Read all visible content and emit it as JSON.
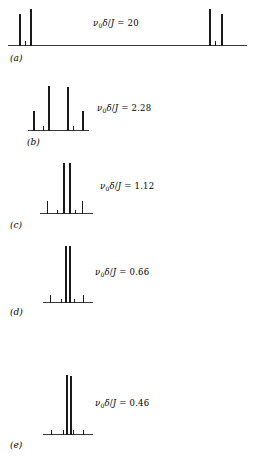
{
  "figure": {
    "ratio_symbol_nu": "ν",
    "ratio_symbol_sub": "0",
    "ratio_symbol_delta": "δ",
    "ratio_symbol_slash": "/",
    "ratio_symbol_j": "J",
    "ratio_symbol_equals": "="
  },
  "panels": [
    {
      "id": "a",
      "label": "(a)",
      "ratio_value": "20",
      "ratio_text": "ν₀δ/J = 20",
      "axis_left": 8,
      "axis_width": 239,
      "axis_height": 40,
      "peaks": [
        {
          "position": 0.0461,
          "height": 0.8,
          "name": "outer-left"
        },
        {
          "position": 0.0712,
          "height": 0.13,
          "name": "satellite-left"
        },
        {
          "position": 0.0921,
          "height": 0.92,
          "name": "inner-left"
        },
        {
          "position": 0.841,
          "height": 0.92,
          "name": "inner-right"
        },
        {
          "position": 0.8661,
          "height": 0.13,
          "name": "satellite-right"
        },
        {
          "position": 0.8912,
          "height": 0.8,
          "name": "outer-right"
        }
      ]
    },
    {
      "id": "b",
      "label": "(b)",
      "ratio_value": "2.28",
      "ratio_text": "ν₀δ/J = 2.28",
      "axis_left": 28,
      "axis_width": 61,
      "axis_height": 46,
      "peaks": [
        {
          "position": 0.085,
          "height": 0.44,
          "name": "outer-left"
        },
        {
          "position": 0.245,
          "height": 0.1,
          "name": "satellite-left"
        },
        {
          "position": 0.33,
          "height": 0.98,
          "name": "inner-left"
        },
        {
          "position": 0.64,
          "height": 0.96,
          "name": "inner-right"
        },
        {
          "position": 0.74,
          "height": 0.1,
          "name": "satellite-right"
        },
        {
          "position": 0.88,
          "height": 0.44,
          "name": "outer-right"
        }
      ]
    },
    {
      "id": "c",
      "label": "(c)",
      "ratio_value": "1.12",
      "ratio_text": "ν₀δ/J = 1.12",
      "axis_left": 40,
      "axis_width": 53,
      "axis_height": 52,
      "peaks": [
        {
          "position": 0.13,
          "height": 0.25,
          "name": "outer-left"
        },
        {
          "position": 0.33,
          "height": 0.07,
          "name": "satellite-left"
        },
        {
          "position": 0.43,
          "height": 0.98,
          "name": "inner-left"
        },
        {
          "position": 0.545,
          "height": 0.98,
          "name": "inner-right"
        },
        {
          "position": 0.655,
          "height": 0.07,
          "name": "satellite-right"
        },
        {
          "position": 0.8,
          "height": 0.25,
          "name": "outer-right"
        }
      ]
    },
    {
      "id": "d",
      "label": "(d)",
      "ratio_value": "0.66",
      "ratio_text": "ν₀δ/J = 0.66",
      "axis_left": 43,
      "axis_width": 50,
      "axis_height": 58,
      "peaks": [
        {
          "position": 0.14,
          "height": 0.13,
          "name": "outer-left"
        },
        {
          "position": 0.36,
          "height": 0.07,
          "name": "satellite-left"
        },
        {
          "position": 0.44,
          "height": 0.99,
          "name": "inner-left"
        },
        {
          "position": 0.52,
          "height": 0.99,
          "name": "inner-right"
        },
        {
          "position": 0.62,
          "height": 0.07,
          "name": "satellite-right"
        },
        {
          "position": 0.8,
          "height": 0.13,
          "name": "outer-right"
        }
      ]
    },
    {
      "id": "e",
      "label": "(e)",
      "ratio_value": "0.46",
      "ratio_text": "ν₀δ/J = 0.46",
      "axis_left": 43,
      "axis_width": 50,
      "axis_height": 60,
      "peaks": [
        {
          "position": 0.16,
          "height": 0.085,
          "name": "outer-left"
        },
        {
          "position": 0.4,
          "height": 0.09,
          "name": "satellite-left"
        },
        {
          "position": 0.465,
          "height": 1.0,
          "name": "inner-left"
        },
        {
          "position": 0.53,
          "height": 0.99,
          "name": "inner-right"
        },
        {
          "position": 0.6,
          "height": 0.09,
          "name": "satellite-right"
        },
        {
          "position": 0.79,
          "height": 0.085,
          "name": "outer-right"
        }
      ]
    }
  ],
  "chart_data": {
    "type": "line",
    "xlabel": "",
    "ylabel": "",
    "grid": false,
    "legend": "none",
    "series": [
      {
        "name": "ν₀δ/J = 20",
        "ratio": 20,
        "panel": "a",
        "line_positions": [
          0.0461,
          0.0712,
          0.0921,
          0.841,
          0.8661,
          0.8912
        ],
        "intensities": [
          0.8,
          0.13,
          0.92,
          0.92,
          0.13,
          0.8
        ]
      },
      {
        "name": "ν₀δ/J = 2.28",
        "ratio": 2.28,
        "panel": "b",
        "line_positions": [
          0.085,
          0.245,
          0.33,
          0.64,
          0.74,
          0.88
        ],
        "intensities": [
          0.44,
          0.1,
          0.98,
          0.96,
          0.1,
          0.44
        ]
      },
      {
        "name": "ν₀δ/J = 1.12",
        "ratio": 1.12,
        "panel": "c",
        "line_positions": [
          0.13,
          0.33,
          0.43,
          0.545,
          0.655,
          0.8
        ],
        "intensities": [
          0.25,
          0.07,
          0.98,
          0.98,
          0.07,
          0.25
        ]
      },
      {
        "name": "ν₀δ/J = 0.66",
        "ratio": 0.66,
        "panel": "d",
        "line_positions": [
          0.14,
          0.36,
          0.44,
          0.52,
          0.62,
          0.8
        ],
        "intensities": [
          0.13,
          0.07,
          0.99,
          0.99,
          0.07,
          0.13
        ]
      },
      {
        "name": "ν₀δ/J = 0.46",
        "ratio": 0.46,
        "panel": "e",
        "line_positions": [
          0.16,
          0.4,
          0.465,
          0.53,
          0.6,
          0.79
        ],
        "intensities": [
          0.085,
          0.09,
          1.0,
          0.99,
          0.09,
          0.085
        ]
      }
    ]
  },
  "colors": {
    "peak": "#1a1a1a",
    "baseline": "#3a3a3a",
    "text": "#000000",
    "background": "#ffffff"
  }
}
